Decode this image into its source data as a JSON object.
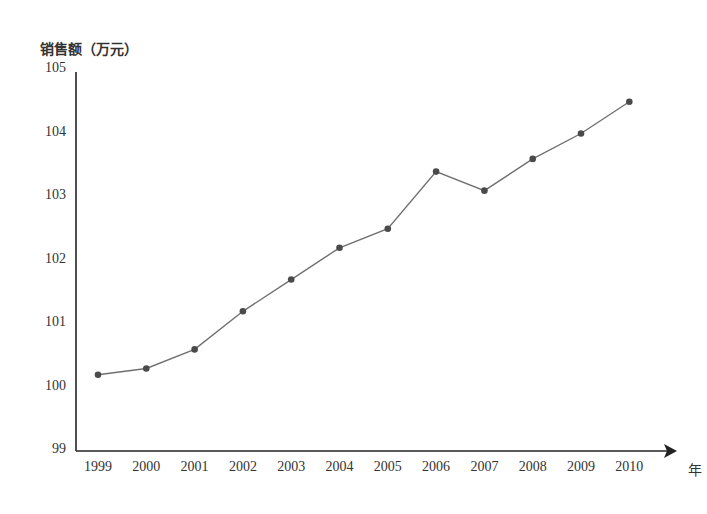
{
  "chart_data": {
    "type": "line",
    "title": "",
    "ylabel": "销售额（万元）",
    "xlabel": "年",
    "x": [
      "1999",
      "2000",
      "2001",
      "2002",
      "2003",
      "2004",
      "2005",
      "2006",
      "2007",
      "2008",
      "2009",
      "2010"
    ],
    "series": [
      {
        "name": "销售额",
        "values": [
          100.2,
          100.3,
          100.6,
          101.2,
          101.7,
          102.2,
          102.5,
          103.4,
          103.1,
          103.6,
          104.0,
          104.5
        ]
      }
    ],
    "ylim": [
      99,
      105
    ],
    "yticks": [
      "99",
      "100",
      "101",
      "102",
      "103",
      "104",
      "105"
    ],
    "grid": false,
    "legend": "none",
    "colors": {
      "line": "#707070",
      "marker": "#4a4a4a",
      "axis": "#222222"
    }
  }
}
